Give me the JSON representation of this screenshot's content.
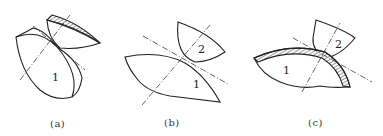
{
  "diagram": {
    "stroke_color": "#222222",
    "panels": [
      {
        "id": "a",
        "caption": "(a)",
        "body1_label": "1"
      },
      {
        "id": "b",
        "caption": "(b)",
        "body1_label": "1",
        "body2_label": "2"
      },
      {
        "id": "c",
        "caption": "(c)",
        "body1_label": "1",
        "body2_label": "2"
      }
    ]
  }
}
